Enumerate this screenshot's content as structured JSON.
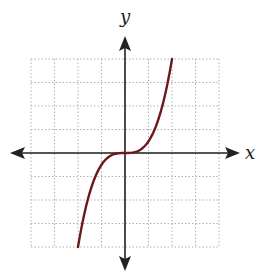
{
  "chart_data": {
    "type": "line",
    "title": "",
    "xlabel": "x",
    "ylabel": "y",
    "xlim": [
      -4,
      4
    ],
    "ylim": [
      -4,
      4
    ],
    "grid": true,
    "grid_style": "dotted",
    "grid_step": 1,
    "series": [
      {
        "name": "f(x)",
        "function": "y = x^3 / 2",
        "color": "#6b1a1a",
        "x": [
          -2,
          -1.5,
          -1,
          -0.5,
          0,
          0.5,
          1,
          1.5,
          2
        ],
        "values": [
          -4,
          -1.6875,
          -0.5,
          -0.0625,
          0,
          0.0625,
          0.5,
          1.6875,
          4
        ]
      }
    ],
    "colors": {
      "axis": "#222222",
      "grid": "#b0b0b0",
      "curve": "#6b1a1a"
    }
  },
  "labels": {
    "x_axis": "x",
    "y_axis": "y"
  }
}
